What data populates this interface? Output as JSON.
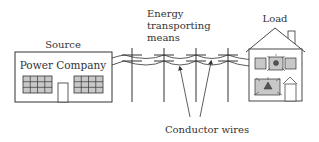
{
  "diagram": {
    "labels": {
      "source": "Source",
      "power_company": "Power Company",
      "energy_line1": "Energy",
      "energy_line2": "transporting",
      "energy_line3": "means",
      "load": "Load",
      "conductor_wires": "Conductor wires"
    },
    "colors": {
      "stroke": "#333333",
      "window_fill": "#c8c8c8",
      "background": "#ffffff"
    }
  }
}
